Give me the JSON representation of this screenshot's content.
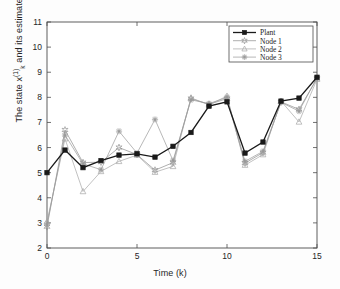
{
  "figure": {
    "background_color": "#fdfdfd",
    "axes_color": "#4d4d4d"
  },
  "chart_data": {
    "type": "line",
    "title": "",
    "xlabel": "Time (k)",
    "ylabel": "The state x_k^(1) and its estimates",
    "ylabel_parts": {
      "prefix": "The state x",
      "superscript": "(1)",
      "subscript": "k",
      "suffix": " and its estimates"
    },
    "xlim": [
      0,
      15
    ],
    "ylim": [
      2,
      11
    ],
    "xticks": [
      0,
      5,
      10,
      15
    ],
    "yticks": [
      2,
      3,
      4,
      5,
      6,
      7,
      8,
      9,
      10,
      11
    ],
    "grid": false,
    "legend_position": "top-right",
    "x": [
      0,
      1,
      2,
      3,
      4,
      5,
      6,
      7,
      8,
      9,
      10,
      11,
      12,
      13,
      14,
      15
    ],
    "series": [
      {
        "name": "Plant",
        "marker": "filled-square",
        "color": "#1a1a1a",
        "linewidth": 1.3,
        "values": [
          5.0,
          5.9,
          5.2,
          5.48,
          5.7,
          5.75,
          5.62,
          6.05,
          6.6,
          7.65,
          7.82,
          5.78,
          6.22,
          7.85,
          7.97,
          8.8
        ]
      },
      {
        "name": "Node 1",
        "marker": "star",
        "color": "#8c8c8c",
        "linewidth": 0.7,
        "values": [
          2.85,
          6.7,
          5.4,
          5.42,
          6.0,
          5.72,
          5.1,
          5.4,
          7.95,
          7.72,
          7.95,
          5.38,
          5.8,
          7.82,
          7.52,
          8.75
        ]
      },
      {
        "name": "Node 2",
        "marker": "triangle",
        "color": "#a6a6a6",
        "linewidth": 0.7,
        "values": [
          3.05,
          6.35,
          4.25,
          5.05,
          5.45,
          5.7,
          5.02,
          5.25,
          7.98,
          7.7,
          8.05,
          5.3,
          5.72,
          7.85,
          7.02,
          8.72
        ]
      },
      {
        "name": "Node 3",
        "marker": "asterisk",
        "color": "#999999",
        "linewidth": 0.7,
        "values": [
          2.95,
          6.5,
          5.35,
          5.12,
          6.65,
          5.78,
          7.12,
          5.48,
          7.9,
          7.75,
          8.0,
          5.45,
          5.85,
          7.8,
          7.45,
          8.78
        ]
      }
    ]
  }
}
